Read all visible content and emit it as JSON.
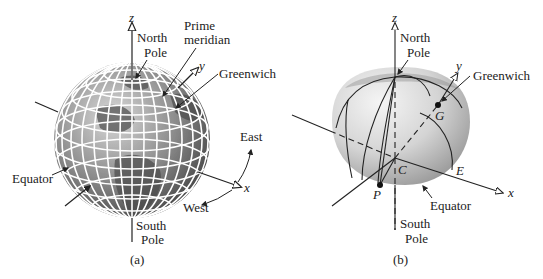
{
  "figure_a": {
    "caption": "(a)",
    "labels": {
      "z_axis": "z",
      "y_axis": "y",
      "x_axis": "x",
      "north_pole_1": "North",
      "north_pole_2": "Pole",
      "prime_meridian_1": "Prime",
      "prime_meridian_2": "meridian",
      "greenwich": "Greenwich",
      "east": "East",
      "west": "West",
      "equator": "Equator",
      "south_pole_1": "South",
      "south_pole_2": "Pole"
    }
  },
  "figure_b": {
    "caption": "(b)",
    "labels": {
      "z_axis": "z",
      "y_axis": "y",
      "x_axis": "x",
      "north_pole_1": "North",
      "north_pole_2": "Pole",
      "greenwich": "Greenwich",
      "point_g": "G",
      "point_c": "C",
      "point_e": "E",
      "point_p": "P",
      "equator": "Equator",
      "south_pole_1": "South",
      "south_pole_2": "Pole"
    }
  },
  "colors": {
    "globe_dark": "#555555",
    "globe_light": "#d8d8d8",
    "grid_lines": "#ffffff",
    "hemisphere_light": "#eeeeee",
    "hemisphere_dark": "#9a9a9a",
    "ink": "#222222"
  }
}
